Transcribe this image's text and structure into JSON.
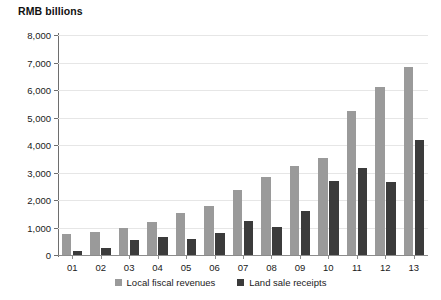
{
  "chart_data": {
    "type": "bar",
    "title": "RMB billions",
    "xlabel": "",
    "ylabel": "RMB billions",
    "ylim": [
      0,
      8000
    ],
    "ytick_labels": [
      "8,000",
      "7,000",
      "6,000",
      "5,000",
      "4,000",
      "3,000",
      "2,000",
      "1,000",
      "0"
    ],
    "ytick_values": [
      8000,
      7000,
      6000,
      5000,
      4000,
      3000,
      2000,
      1000,
      0
    ],
    "grid": true,
    "legend_position": "bottom-center",
    "categories": [
      "01",
      "02",
      "03",
      "04",
      "05",
      "06",
      "07",
      "08",
      "09",
      "10",
      "11",
      "12",
      "13"
    ],
    "series": [
      {
        "name": "Local fiscal revenues",
        "color": "#9a9a9a",
        "values": [
          780,
          850,
          990,
          1190,
          1510,
          1790,
          2360,
          2850,
          3250,
          3520,
          5240,
          6100,
          6850
        ]
      },
      {
        "name": "Land sale receipts",
        "color": "#3b3b3b",
        "values": [
          130,
          240,
          560,
          640,
          590,
          810,
          1220,
          1020,
          1590,
          2700,
          3150,
          2650,
          4200
        ]
      }
    ]
  }
}
